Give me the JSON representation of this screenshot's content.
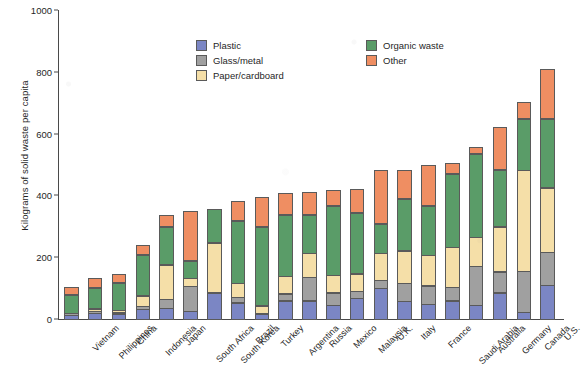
{
  "chart_data": {
    "type": "bar",
    "stacked": true,
    "title": "",
    "subtitle": "",
    "xlabel": "",
    "ylabel": "Kilograms of solid waste per capita",
    "ylim": [
      0,
      1000
    ],
    "yticks": [
      0,
      200,
      400,
      600,
      800,
      1000
    ],
    "ytick_labels": [
      "0",
      "200",
      "400",
      "600",
      "800",
      "1000"
    ],
    "grid": false,
    "legend_position": "upper-left-inside",
    "units": "kilograms per capita",
    "categories": [
      "Vietnam",
      "Philippines",
      "China",
      "Indonesia",
      "Japan",
      "South Africa",
      "South Korea",
      "Brazil",
      "Turkey",
      "Argentina",
      "Russia",
      "Mexico",
      "Malaysia",
      "U.K.",
      "Italy",
      "France",
      "Saudi Arabia",
      "Australia",
      "Germany",
      "Canada",
      "U.S."
    ],
    "series": [
      {
        "name": "Plastic",
        "color": "#7b86c4",
        "values": [
          15,
          22,
          20,
          35,
          38,
          28,
          88,
          55,
          20,
          62,
          62,
          48,
          70,
          102,
          60,
          50,
          62,
          48,
          88,
          25,
          112
        ]
      },
      {
        "name": "Glass/metal",
        "color": "#a0a0a0",
        "values": [
          8,
          8,
          6,
          12,
          30,
          82,
          0,
          20,
          0,
          25,
          78,
          42,
          25,
          28,
          60,
          62,
          45,
          128,
          70,
          135,
          108
        ]
      },
      {
        "name": "Paper/cardboard",
        "color": "#f5dfa8",
        "values": [
          0,
          10,
          8,
          35,
          115,
          30,
          162,
          48,
          28,
          58,
          80,
          58,
          58,
          90,
          108,
          102,
          133,
          95,
          148,
          328,
          212
        ]
      },
      {
        "name": "Organic waste",
        "color": "#5a9c68",
        "values": [
          62,
          70,
          92,
          135,
          125,
          58,
          112,
          203,
          255,
          200,
          125,
          228,
          200,
          98,
          168,
          160,
          238,
          272,
          185,
          168,
          225
        ]
      },
      {
        "name": "Other",
        "color": "#ef8e62",
        "values": [
          25,
          32,
          28,
          32,
          38,
          160,
          0,
          65,
          98,
          72,
          75,
          50,
          78,
          172,
          95,
          132,
          37,
          22,
          138,
          55,
          160
        ]
      }
    ],
    "totals": [
      110,
      142,
      154,
      249,
      346,
      358,
      362,
      391,
      401,
      417,
      420,
      426,
      431,
      490,
      491,
      506,
      515,
      565,
      629,
      711,
      817
    ]
  },
  "legend": {
    "items": [
      {
        "label": "Plastic",
        "color": "#7b86c4"
      },
      {
        "label": "Glass/metal",
        "color": "#a0a0a0"
      },
      {
        "label": "Paper/cardboard",
        "color": "#f5dfa8"
      },
      {
        "label": "Organic waste",
        "color": "#5a9c68"
      },
      {
        "label": "Other",
        "color": "#ef8e62"
      }
    ]
  }
}
